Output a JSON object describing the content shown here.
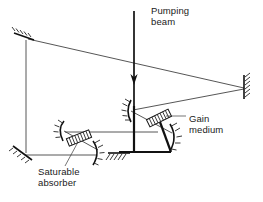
{
  "figure": {
    "background_color": "#ffffff",
    "line_color": "#111111",
    "text_color": "#1a1a1a",
    "width": 263,
    "height": 202
  },
  "labels": {
    "pumping_beam": "Pumping\nbeam",
    "gain_medium": "Gain\nmedium",
    "saturable_absorber": "Saturable\nabsorber"
  },
  "components": [
    {
      "id": "mirror-top-left",
      "name": "flat mirror",
      "kind": "flat-mirror",
      "x": 24,
      "y": 35
    },
    {
      "id": "mirror-right",
      "name": "flat mirror",
      "kind": "flat-mirror",
      "x": 245,
      "y": 86
    },
    {
      "id": "mirror-bottom-left",
      "name": "flat mirror",
      "kind": "flat-mirror",
      "x": 21,
      "y": 152
    },
    {
      "id": "mirror-bottom-center",
      "name": "flat mirror",
      "kind": "flat-mirror",
      "x": 119,
      "y": 151
    },
    {
      "id": "mirror-curved-gain-left",
      "name": "concave mirror",
      "kind": "curved-mirror",
      "x": 129,
      "y": 110
    },
    {
      "id": "mirror-curved-gain-right",
      "name": "concave mirror",
      "kind": "curved-mirror",
      "x": 174,
      "y": 137
    },
    {
      "id": "mirror-curved-absorber-left",
      "name": "concave mirror",
      "kind": "curved-mirror",
      "x": 61,
      "y": 129
    },
    {
      "id": "mirror-curved-absorber-right",
      "name": "concave mirror",
      "kind": "curved-mirror",
      "x": 97,
      "y": 153
    },
    {
      "id": "crystal-gain-medium",
      "name": "gain medium crystal",
      "kind": "crystal",
      "x": 159,
      "y": 119
    },
    {
      "id": "crystal-saturable-absorber",
      "name": "saturable absorber crystal",
      "kind": "crystal",
      "x": 79,
      "y": 139
    }
  ],
  "beams": {
    "pumping_beam_direction": "down",
    "cavity_path": "folded"
  }
}
